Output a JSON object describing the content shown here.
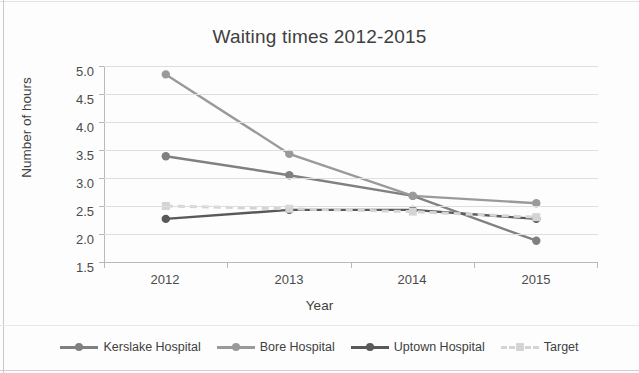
{
  "chart_data": {
    "type": "line",
    "title": "Waiting times 2012-2015",
    "xlabel": "Year",
    "ylabel": "Number of hours",
    "categories": [
      "2012",
      "2013",
      "2014",
      "2015"
    ],
    "ylim": [
      1.5,
      5.0
    ],
    "yticks": [
      "1.5",
      "2.0",
      "2.5",
      "3.0",
      "3.5",
      "4.0",
      "4.5",
      "5.0"
    ],
    "grid": true,
    "legend_position": "bottom",
    "series": [
      {
        "name": "Kerslake Hospital",
        "values": [
          3.39,
          3.05,
          2.68,
          1.88
        ],
        "color": "#808080",
        "style": "solid",
        "marker": "circle"
      },
      {
        "name": "Bore Hospital",
        "values": [
          4.85,
          3.43,
          2.68,
          2.55
        ],
        "color": "#9a9a9a",
        "style": "solid",
        "marker": "circle"
      },
      {
        "name": "Uptown Hospital",
        "values": [
          2.27,
          2.43,
          2.43,
          2.27
        ],
        "color": "#595959",
        "style": "solid",
        "marker": "circle"
      },
      {
        "name": "Target",
        "values": [
          2.5,
          2.45,
          2.4,
          2.3
        ],
        "color": "#d4d4d4",
        "style": "dashed",
        "marker": "square"
      }
    ]
  },
  "legend": [
    {
      "label": "Kerslake Hospital"
    },
    {
      "label": "Bore Hospital"
    },
    {
      "label": "Uptown Hospital"
    },
    {
      "label": "Target"
    }
  ]
}
